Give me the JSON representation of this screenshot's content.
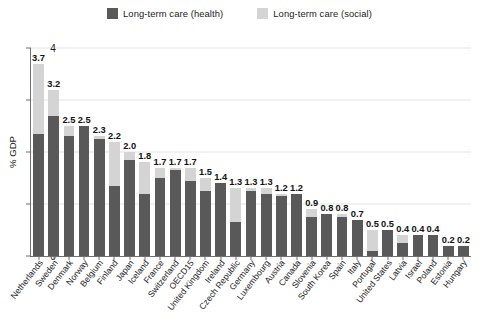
{
  "legend": {
    "items": [
      {
        "label": "Long-term care (health)",
        "color": "#595959",
        "name": "legend-health"
      },
      {
        "label": "Long-term care (social)",
        "color": "#d4d4d4",
        "name": "legend-social"
      }
    ]
  },
  "axis": {
    "ylabel": "% GDP",
    "yticks": [
      "0",
      "1",
      "2",
      "3",
      "4"
    ]
  },
  "chart_data": {
    "type": "bar",
    "title": "",
    "subtitle": "",
    "xlabel": "",
    "ylabel": "% GDP",
    "ylim": [
      0,
      4
    ],
    "yticks": [
      0,
      1,
      2,
      3,
      4
    ],
    "grid": true,
    "stacked": true,
    "legend_position": "top-center",
    "categories": [
      "Netherlands",
      "Sweden",
      "Denmark",
      "Norway",
      "Belgium",
      "Finland",
      "Japan",
      "Iceland",
      "France",
      "Switzerland",
      "OECD15",
      "United Kingdom",
      "Ireland",
      "Czech Republic",
      "Germany",
      "Luxembourg",
      "Austria",
      "Canada",
      "Slovenia",
      "South Korea",
      "Spain",
      "Italy",
      "Portugal",
      "United States",
      "Latvia",
      "Israel",
      "Poland",
      "Estonia",
      "Hungary"
    ],
    "series": [
      {
        "name": "Long-term care (health)",
        "color": "#595959",
        "values": [
          2.35,
          2.7,
          2.3,
          2.5,
          2.25,
          1.35,
          1.85,
          1.2,
          1.5,
          1.65,
          1.45,
          1.25,
          1.4,
          0.65,
          1.25,
          1.2,
          1.15,
          1.2,
          0.75,
          0.8,
          0.75,
          0.7,
          0.1,
          0.5,
          0.25,
          0.4,
          0.4,
          0.2,
          0.2
        ]
      },
      {
        "name": "Long-term care (social)",
        "color": "#d4d4d4",
        "values": [
          1.35,
          0.5,
          0.2,
          0.0,
          0.05,
          0.85,
          0.15,
          0.6,
          0.2,
          0.05,
          0.25,
          0.25,
          0.0,
          0.65,
          0.05,
          0.1,
          0.05,
          0.0,
          0.15,
          0.0,
          0.05,
          0.0,
          0.4,
          0.0,
          0.15,
          0.0,
          0.0,
          0.0,
          0.0
        ]
      }
    ],
    "totals": [
      3.7,
      3.2,
      2.5,
      2.5,
      2.3,
      2.2,
      2.0,
      1.8,
      1.7,
      1.7,
      1.7,
      1.5,
      1.4,
      1.3,
      1.3,
      1.3,
      1.2,
      1.2,
      0.9,
      0.8,
      0.8,
      0.7,
      0.5,
      0.5,
      0.4,
      0.4,
      0.4,
      0.2,
      0.2
    ],
    "value_labels": [
      "3.7",
      "3.2",
      "2.5",
      "2.5",
      "2.3",
      "2.2",
      "2.0",
      "1.8",
      "1.7",
      "1.7",
      "1.7",
      "1.5",
      "1.4",
      "1.3",
      "1.3",
      "1.3",
      "1.2",
      "1.2",
      "0.9",
      "0.8",
      "0.8",
      "0.7",
      "0.5",
      "0.5",
      "0.4",
      "0.4",
      "0.4",
      "0.2",
      "0.2"
    ]
  }
}
